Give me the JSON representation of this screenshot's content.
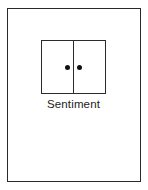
{
  "canvas": {
    "width": 148,
    "height": 190,
    "background_color": "#ffffff"
  },
  "frame": {
    "name": "outer-border",
    "stroke_color": "#2a2a2a",
    "stroke_width": 1.4,
    "fill_color": "#ffffff"
  },
  "diagram": {
    "node": {
      "caption": "Sentiment",
      "shape": "split-rectangle",
      "stroke_color": "#2b2b2b",
      "fill_color": "#ffffff",
      "divider": {
        "orientation": "vertical",
        "color": "#2b2b2b"
      },
      "markers": [
        {
          "label": "left-dot",
          "shape": "filled-circle",
          "color": "#111111",
          "compartment": "left"
        },
        {
          "label": "right-dot",
          "shape": "filled-circle",
          "color": "#111111",
          "compartment": "right"
        }
      ],
      "marker_count": 2
    }
  }
}
